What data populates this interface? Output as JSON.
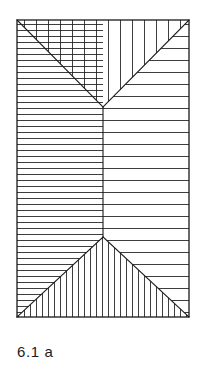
{
  "figure": {
    "caption": "6.1 a",
    "title": "6.1 a",
    "stroke_color": "#1a1a1a",
    "background_color": "#ffffff",
    "border": {
      "x": 17,
      "y": 20,
      "width": 172,
      "height": 297,
      "stroke_width": 1.2
    },
    "geometry": {
      "left": 17,
      "top": 20,
      "right": 189,
      "bottom": 317,
      "top_apex": {
        "x": 103,
        "y": 107
      },
      "bottom_apex": {
        "x": 103,
        "y": 237
      },
      "center_divider_x": 103,
      "band_top_y": 107,
      "band_bottom_y": 237
    },
    "hatch": {
      "fine_spacing": 6,
      "coarse_spacing": 12,
      "line_width": 0.9
    },
    "regions": [
      {
        "name": "top-left-triangle",
        "hatch_direction": "horizontal",
        "hatch_density": "fine",
        "spacing": 6,
        "points": "17,20 103,20 103,107 17,107",
        "clip": "triangle-upper-left"
      },
      {
        "name": "top-center-wedge",
        "hatch_direction": "vertical",
        "hatch_density": "coarse",
        "spacing": 12,
        "points": "17,20 189,20 103,107",
        "clip": "wedge-top"
      },
      {
        "name": "top-right-triangle",
        "hatch_direction": "horizontal",
        "hatch_density": "coarse",
        "spacing": 12,
        "points": "103,107 189,20 189,107",
        "clip": "triangle-upper-right"
      },
      {
        "name": "middle-left-band",
        "hatch_direction": "horizontal",
        "hatch_density": "fine",
        "spacing": 6,
        "points": "17,107 103,107 103,237 17,237",
        "clip": "band-left"
      },
      {
        "name": "middle-right-band",
        "hatch_direction": "horizontal",
        "hatch_density": "coarse",
        "spacing": 12,
        "points": "103,107 189,107 189,237 103,237",
        "clip": "band-right"
      },
      {
        "name": "bottom-left-triangle",
        "hatch_direction": "horizontal",
        "hatch_density": "fine",
        "spacing": 6,
        "points": "17,237 103,237 17,317",
        "clip": "triangle-lower-left"
      },
      {
        "name": "bottom-center-wedge",
        "hatch_direction": "vertical",
        "hatch_density": "fine",
        "spacing": 6,
        "points": "103,237 189,317 17,317",
        "clip": "wedge-bottom"
      },
      {
        "name": "bottom-right-triangle",
        "hatch_direction": "horizontal",
        "hatch_density": "coarse",
        "spacing": 12,
        "points": "103,237 189,237 189,317",
        "clip": "triangle-lower-right"
      }
    ],
    "edges": [
      {
        "name": "outer-rectangle",
        "d": "M17,20 L189,20 L189,317 L17,317 Z"
      },
      {
        "name": "top-left-diagonal",
        "d": "M17,20 L103,107"
      },
      {
        "name": "top-right-diagonal",
        "d": "M189,20 L103,107"
      },
      {
        "name": "center-vertical-divider",
        "d": "M103,107 L103,237"
      },
      {
        "name": "bottom-left-diagonal",
        "d": "M103,237 L17,317"
      },
      {
        "name": "bottom-right-diagonal",
        "d": "M103,237 L189,317"
      }
    ]
  }
}
